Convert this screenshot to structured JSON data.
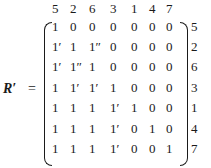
{
  "matrix": {
    "label": "R′",
    "equals": "=",
    "column_headers": [
      "5",
      "2",
      "6",
      "3",
      "1",
      "4",
      "7"
    ],
    "row_labels": [
      "5",
      "2",
      "6",
      "3",
      "1",
      "4",
      "7"
    ],
    "rows": [
      [
        "1",
        "0",
        "0",
        "0",
        "0",
        "0",
        "0"
      ],
      [
        "1′",
        "1",
        "1″",
        "0",
        "0",
        "0",
        "0"
      ],
      [
        "1′",
        "1″",
        "1",
        "0",
        "0",
        "0",
        "0"
      ],
      [
        "1",
        "1′",
        "1′",
        "1",
        "0",
        "0",
        "0"
      ],
      [
        "1",
        "1",
        "1",
        "1′",
        "1",
        "0",
        "0"
      ],
      [
        "1",
        "1",
        "1",
        "1′",
        "0",
        "1",
        "0"
      ],
      [
        "1",
        "1",
        "1",
        "1′",
        "0",
        "0",
        "1"
      ]
    ]
  }
}
